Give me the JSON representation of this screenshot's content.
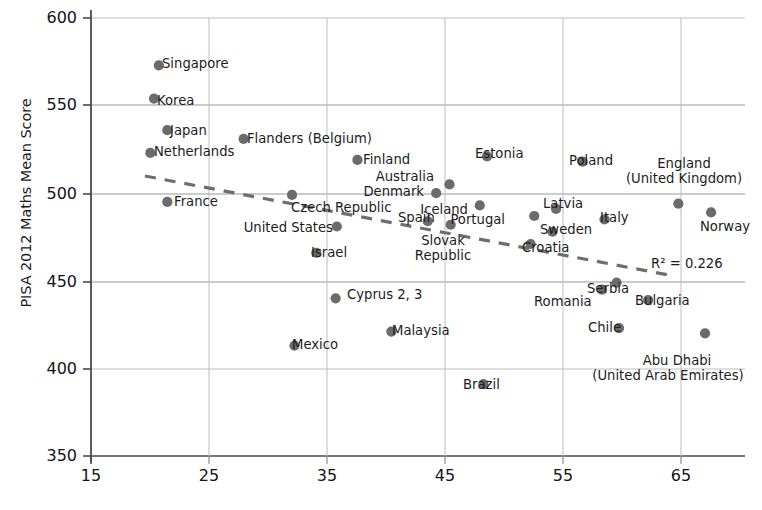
{
  "chart_data": {
    "type": "scatter",
    "title": "",
    "xlabel": "",
    "ylabel": "PISA 2012 Maths Mean Score",
    "xlim": [
      15,
      69
    ],
    "ylim": [
      350,
      600
    ],
    "xticks": [
      15,
      25,
      35,
      45,
      55,
      65
    ],
    "yticks": [
      350,
      400,
      450,
      500,
      550,
      600
    ],
    "grid": true,
    "legend": null,
    "annotation": "R² = 0.226",
    "trendline": {
      "type": "dashed-linear",
      "x_start": 19.6,
      "y_start": 519.5,
      "x_end": 64.4,
      "y_end": 462.5
    },
    "marker_color": "#6b6b6b",
    "points": [
      {
        "label": "Singapore",
        "x": 20.6,
        "y": 573,
        "label_pos": "right"
      },
      {
        "label": "Korea",
        "x": 20.2,
        "y": 554,
        "label_pos": "right"
      },
      {
        "label": "Japan",
        "x": 21.3,
        "y": 536,
        "label_pos": "right"
      },
      {
        "label": "Netherlands",
        "x": 19.9,
        "y": 523,
        "label_pos": "right"
      },
      {
        "label": "Flanders (Belgium)",
        "x": 27.6,
        "y": 531,
        "label_pos": "right"
      },
      {
        "label": "France",
        "x": 21.3,
        "y": 495,
        "label_pos": "right"
      },
      {
        "label": "Czech Republic",
        "x": 31.6,
        "y": 499,
        "label_pos": "below"
      },
      {
        "label": "Finland",
        "x": 37.0,
        "y": 519,
        "label_pos": "right"
      },
      {
        "label": "United States",
        "x": 35.3,
        "y": 481,
        "label_pos": "left"
      },
      {
        "label": "Israel",
        "x": 33.6,
        "y": 466,
        "label_pos": "right"
      },
      {
        "label": "Cyprus 2, 3",
        "x": 35.2,
        "y": 440,
        "label_pos": "right"
      },
      {
        "label": "Mexico",
        "x": 31.8,
        "y": 413,
        "label_pos": "right"
      },
      {
        "label": "Malaysia",
        "x": 39.8,
        "y": 421,
        "label_pos": "right"
      },
      {
        "label": "Spain",
        "x": 42.8,
        "y": 484,
        "label_pos": "right"
      },
      {
        "label": "Australia",
        "x": 44.6,
        "y": 505,
        "label_pos": "left"
      },
      {
        "label": "Denmark",
        "x": 43.5,
        "y": 500,
        "label_pos": "left"
      },
      {
        "label": "Slovak Republic",
        "x": 44.7,
        "y": 482,
        "label_pos": "below"
      },
      {
        "label": "Iceland",
        "x": 47.1,
        "y": 493,
        "label_pos": "left"
      },
      {
        "label": "Estonia",
        "x": 47.7,
        "y": 521,
        "label_pos": "right"
      },
      {
        "label": "Brazil",
        "x": 47.4,
        "y": 391,
        "label_pos": "right"
      },
      {
        "label": "Portugal",
        "x": 51.6,
        "y": 487,
        "label_pos": "left"
      },
      {
        "label": "Croatia",
        "x": 51.3,
        "y": 471,
        "label_pos": "right"
      },
      {
        "label": "Latvia",
        "x": 53.4,
        "y": 491,
        "label_pos": "right"
      },
      {
        "label": "Sweden",
        "x": 53.1,
        "y": 478,
        "label_pos": "right"
      },
      {
        "label": "Poland",
        "x": 55.6,
        "y": 518,
        "label_pos": "right"
      },
      {
        "label": "Italy",
        "x": 57.4,
        "y": 485,
        "label_pos": "right"
      },
      {
        "label": "Serbia",
        "x": 58.4,
        "y": 449,
        "label_pos": "right"
      },
      {
        "label": "Romania",
        "x": 57.2,
        "y": 445,
        "label_pos": "below"
      },
      {
        "label": "Bulgaria",
        "x": 61.0,
        "y": 439,
        "label_pos": "right"
      },
      {
        "label": "Chile",
        "x": 58.6,
        "y": 423,
        "label_pos": "right"
      },
      {
        "label": "England (United Kingdom)",
        "x": 63.5,
        "y": 494,
        "label_pos": "above"
      },
      {
        "label": "Norway",
        "x": 66.2,
        "y": 489,
        "label_pos": "below"
      },
      {
        "label": "Abu Dhabi (United Arab Emirates)",
        "x": 65.7,
        "y": 420,
        "label_pos": "below"
      }
    ]
  },
  "axis": {
    "y_title": "PISA 2012 Maths Mean Score",
    "y_ticks": [
      "600",
      "550",
      "500",
      "450",
      "400",
      "350"
    ],
    "x_ticks": [
      "15",
      "25",
      "35",
      "45",
      "55",
      "65"
    ]
  },
  "labels": {
    "singapore": "Singapore",
    "korea": "Korea",
    "japan": "Japan",
    "netherlands": "Netherlands",
    "flanders": "Flanders (Belgium)",
    "france": "France",
    "czech_republic": "Czech Republic",
    "finland": "Finland",
    "united_states": "United States",
    "israel": "Israel",
    "cyprus": "Cyprus 2, 3",
    "mexico": "Mexico",
    "malaysia": "Malaysia",
    "spain": "Spain",
    "australia": "Australia",
    "denmark": "Denmark",
    "slovak_line1": "Slovak",
    "slovak_line2": "Republic",
    "iceland": "Iceland",
    "estonia": "Estonia",
    "brazil": "Brazil",
    "portugal": "Portugal",
    "croatia": "Croatia",
    "latvia": "Latvia",
    "sweden": "Sweden",
    "poland": "Poland",
    "italy": "Italy",
    "serbia": "Serbia",
    "romania": "Romania",
    "bulgaria": "Bulgaria",
    "chile": "Chile",
    "england_line1": "England",
    "england_line2": "(United Kingdom)",
    "norway": "Norway",
    "abudhabi_line1": "Abu Dhabi",
    "abudhabi_line2": "(United Arab Emirates)",
    "r2": "R² = 0.226"
  },
  "colors": {
    "marker": "#6b6b6b",
    "grid": "#b4b4b4",
    "axis": "#4a4a4a",
    "text": "#1a1a1a",
    "trendline": "#6e6e6e"
  }
}
